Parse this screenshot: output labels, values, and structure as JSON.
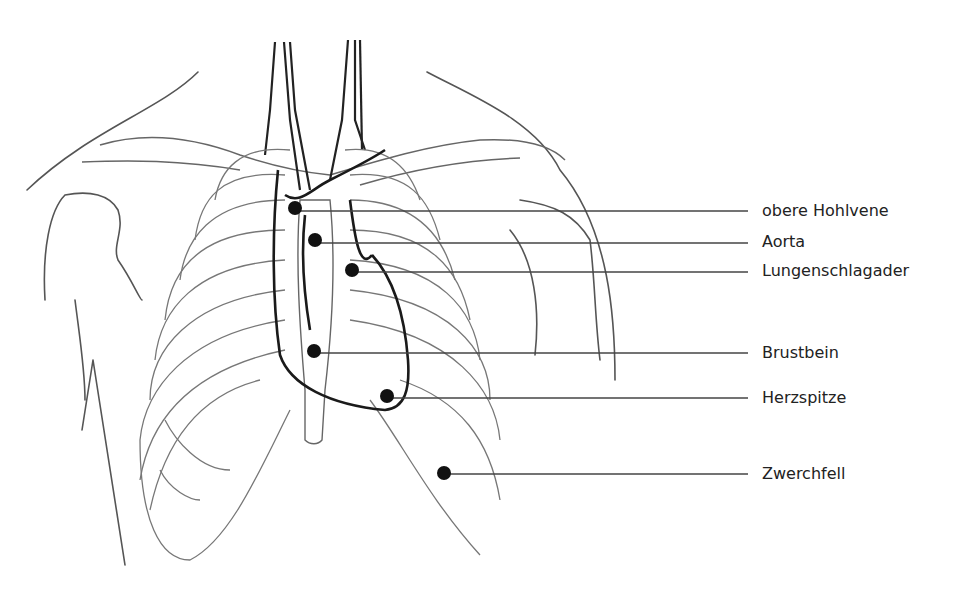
{
  "figure": {
    "line_color": "#555555",
    "heart_outline_color": "#1a1a1a",
    "dot_color": "#111111"
  },
  "labels": [
    {
      "text": "obere Hohlvene",
      "dot": [
        295,
        208
      ],
      "line_y": 211,
      "label_y": 202
    },
    {
      "text": "Aorta",
      "dot": [
        315,
        240
      ],
      "line_y": 243,
      "label_y": 233
    },
    {
      "text": "Lungenschlagader",
      "dot": [
        352,
        270
      ],
      "line_y": 272,
      "label_y": 262
    },
    {
      "text": "Brustbein",
      "dot": [
        314,
        351
      ],
      "line_y": 353,
      "label_y": 344
    },
    {
      "text": "Herzspitze",
      "dot": [
        387,
        396
      ],
      "line_y": 398,
      "label_y": 389
    },
    {
      "text": "Zwerchfell",
      "dot": [
        444,
        473
      ],
      "line_y": 474,
      "label_y": 465
    }
  ],
  "leader_end_x": 748
}
